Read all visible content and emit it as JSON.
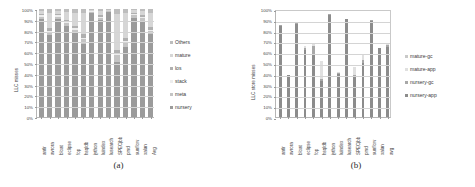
{
  "figure": {
    "panel_a_caption": "(a)",
    "panel_b_caption": "(b)"
  },
  "chart_data": [
    {
      "id": "panel-a",
      "type": "bar",
      "stacked": true,
      "normalized": true,
      "title": "",
      "xlabel": "",
      "ylabel": "LLC misses",
      "ylim": [
        0,
        100
      ],
      "ytick_labels": [
        "0%",
        "10%",
        "20%",
        "30%",
        "40%",
        "50%",
        "60%",
        "70%",
        "80%",
        "90%",
        "100%"
      ],
      "ytick_values": [
        0,
        10,
        20,
        30,
        40,
        50,
        60,
        70,
        80,
        90,
        100
      ],
      "grid": true,
      "legend_position": "right",
      "categories": [
        "antlr",
        "avrora",
        "bloat",
        "eclipse",
        "fop",
        "hsqldb",
        "jython",
        "luindex",
        "lusearch",
        "SPECjbb",
        "pmd",
        "sunflow",
        "xalan",
        "Avg"
      ],
      "series": [
        {
          "name": "nursery",
          "color": "#9b9b9b",
          "values": [
            91,
            76,
            91,
            84,
            78,
            68,
            96,
            90,
            97,
            51,
            65,
            92,
            89,
            77
          ]
        },
        {
          "name": "meta",
          "color": "#c4c4c4",
          "values": [
            2,
            3,
            2,
            3,
            3,
            4,
            1,
            2,
            1,
            6,
            4,
            2,
            3,
            3
          ]
        },
        {
          "name": "stack",
          "color": "#ededed",
          "values": [
            1,
            1,
            1,
            1,
            1,
            1,
            1,
            1,
            0,
            2,
            1,
            1,
            1,
            1
          ]
        },
        {
          "name": "los",
          "color": "#b0b0b0",
          "values": [
            1,
            2,
            1,
            2,
            2,
            4,
            0,
            1,
            0,
            3,
            3,
            1,
            1,
            2
          ]
        },
        {
          "name": "mature",
          "color": "#d6d6d6",
          "values": [
            3,
            14,
            3,
            7,
            12,
            19,
            1,
            4,
            1,
            33,
            23,
            3,
            4,
            13
          ]
        },
        {
          "name": "Others",
          "color": "#bdbdbd",
          "values": [
            2,
            4,
            2,
            3,
            4,
            4,
            1,
            2,
            1,
            5,
            4,
            1,
            2,
            4
          ]
        }
      ],
      "legend_entries": [
        "Others",
        "mature",
        "los",
        "stack",
        "meta",
        "nursery"
      ]
    },
    {
      "id": "panel-b",
      "type": "bar",
      "stacked": true,
      "normalized": false,
      "title": "",
      "xlabel": "",
      "ylabel": "LLC store misses",
      "ylim": [
        0,
        100
      ],
      "ytick_labels": [
        "0%",
        "10%",
        "20%",
        "30%",
        "40%",
        "50%",
        "60%",
        "70%",
        "80%",
        "90%",
        "100%"
      ],
      "ytick_values": [
        0,
        10,
        20,
        30,
        40,
        50,
        60,
        70,
        80,
        90,
        100
      ],
      "grid": true,
      "legend_position": "right",
      "categories": [
        "antlr",
        "avrora",
        "bloat",
        "eclipse",
        "fop",
        "hsqldb",
        "jython",
        "luindex",
        "lusearch",
        "SPECjbb",
        "pmd",
        "sunflow",
        "xalan",
        "avg"
      ],
      "series": [
        {
          "name": "nursery-app",
          "color": "#8c8c8c",
          "values": [
            84,
            39,
            86,
            62,
            58,
            33,
            94,
            40,
            91,
            37,
            50,
            89,
            64,
            65
          ]
        },
        {
          "name": "nursery-gc",
          "color": "#a8a8a8",
          "values": [
            1,
            0,
            1,
            2,
            8,
            2,
            1,
            1,
            0,
            2,
            3,
            1,
            0,
            2
          ]
        },
        {
          "name": "mature-app",
          "color": "#e0e0e0",
          "values": [
            0,
            0,
            0,
            2,
            2,
            17,
            0,
            1,
            0,
            7,
            4,
            0,
            0,
            1
          ]
        },
        {
          "name": "mature-gc",
          "color": "#c9c9c9",
          "values": [
            0,
            0,
            0,
            0,
            0,
            0,
            0,
            0,
            0,
            0,
            0,
            0,
            0,
            0
          ]
        }
      ],
      "legend_entries": [
        "mature-gc",
        "mature-app",
        "nursery-gc",
        "nursery-app"
      ],
      "totals": [
        85,
        39,
        87,
        66,
        68,
        52,
        95,
        42,
        91,
        46,
        57,
        90,
        64,
        68
      ]
    }
  ]
}
